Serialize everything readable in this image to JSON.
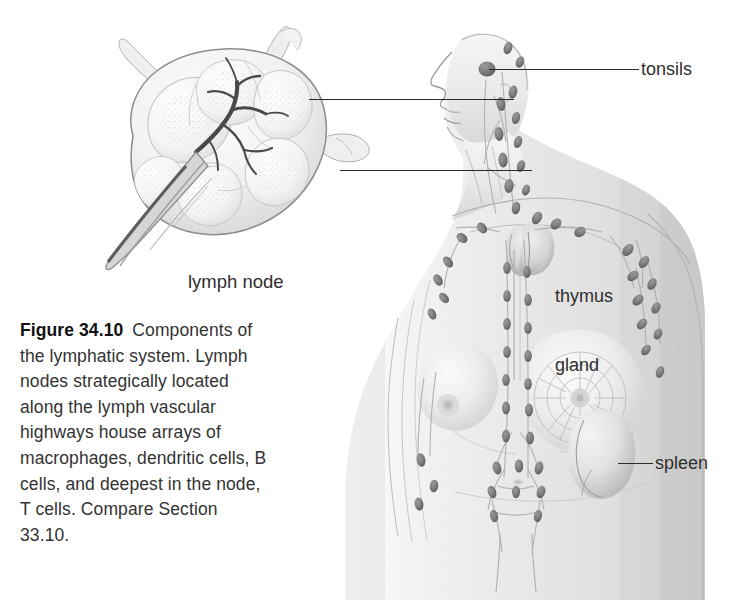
{
  "figure": {
    "number": "Figure 34.10",
    "caption_text": "Components of the lymphatic system. Lymph nodes strategically located along the lymph vascular highways house arrays of macrophages, dendritic cells, B cells, and deepest in the node, T cells. Compare Section 33.10.",
    "background_color": "#ffffff",
    "ink_color": "#2a2a2a",
    "illustration_style": "grayscale-airbrush-anatomical"
  },
  "labels": {
    "tonsils": "tonsils",
    "thymus_gland_line1": "thymus",
    "thymus_gland_line2": "gland",
    "spleen": "spleen",
    "lymph_node": "lymph node"
  },
  "inset": {
    "title": "lymph node",
    "description": "cross-section of a lobed lymph node with afferent vessels entering at top and efferent vessel plus branching hilar vessels exiting at lower left"
  },
  "body_figure": {
    "description": "female torso in three-quarter view, head in left profile, showing lymphatic vessels and lymph node chains",
    "organs": [
      "tonsils",
      "cervical lymph nodes",
      "thymus gland",
      "axillary lymph nodes",
      "breast lymphatic network",
      "spleen",
      "abdominal lymph node chains",
      "inguinal lymph nodes"
    ]
  }
}
